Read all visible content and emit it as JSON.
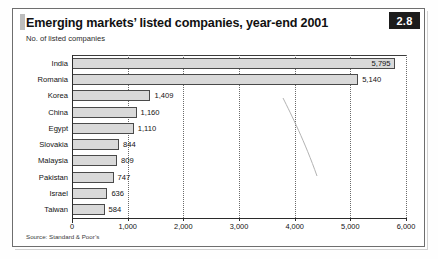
{
  "figure": {
    "badge_label": "2.8",
    "title": "Emerging markets’ listed companies, year-end 2001",
    "subtitle": "No. of listed companies",
    "source": "Source: Standard & Poor’s"
  },
  "colors": {
    "bar_fill": "#d9d9d9",
    "bar_stroke": "#4a4a4a",
    "badge_bg": "#1c1c1c",
    "badge_text": "#ffffff",
    "frame": "#6e6e6e",
    "gridline": "#6a6a6a",
    "text": "#121212"
  },
  "chart_data": {
    "type": "bar",
    "orientation": "horizontal",
    "title": "Emerging markets’ listed companies, year-end 2001",
    "subtitle": "No. of listed companies",
    "xlabel": "",
    "ylabel": "",
    "xlim": [
      0,
      6000
    ],
    "xticks": [
      0,
      1000,
      2000,
      3000,
      4000,
      5000,
      6000
    ],
    "xticklabels": [
      "0",
      "1,000",
      "2,000",
      "3,000",
      "4,000",
      "5,000",
      "6,000"
    ],
    "grid": "vertical-dotted",
    "legend": "none",
    "categories": [
      "India",
      "Romania",
      "Korea",
      "China",
      "Egypt",
      "Slovakia",
      "Malaysia",
      "Pakistan",
      "Israel",
      "Taiwan"
    ],
    "values": [
      5795,
      5140,
      1409,
      1160,
      1110,
      844,
      809,
      747,
      636,
      584
    ],
    "value_labels": [
      "5,795",
      "5,140",
      "1,409",
      "1,160",
      "1,110",
      "844",
      "809",
      "747",
      "636",
      "584"
    ],
    "label_placement": [
      "inside",
      "outside",
      "outside",
      "outside",
      "outside",
      "outside",
      "outside",
      "outside",
      "outside",
      "outside"
    ],
    "source": "Source: Standard & Poor’s"
  }
}
